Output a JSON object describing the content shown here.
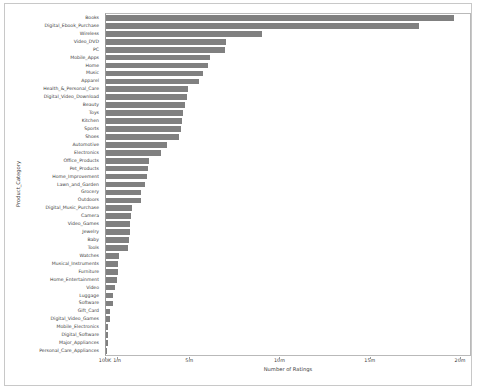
{
  "figure": {
    "background_color": "#ffffff",
    "border_color": "#c8c8c8",
    "bar_color": "#808080"
  },
  "chart_data": {
    "type": "bar",
    "orientation": "horizontal",
    "title": "",
    "xlabel": "Number of Ratings",
    "ylabel": "Product_Category",
    "xscale": "symlog",
    "xlim": [
      100000,
      20500000
    ],
    "xticks": [
      100000,
      1000000,
      5000000,
      10000000,
      15000000,
      20000000
    ],
    "xticklabels": [
      "100K",
      "1m",
      "5m",
      "10m",
      "15m",
      "20m"
    ],
    "grid": false,
    "legend": null,
    "categories": [
      "Books",
      "Digital_Ebook_Purchase",
      "Wireless",
      "Video_DVD",
      "PC",
      "Mobile_Apps",
      "Home",
      "Music",
      "Apparel",
      "Health_&_Personal_Care",
      "Digital_Video_Download",
      "Beauty",
      "Toys",
      "Kitchen",
      "Sports",
      "Shoes",
      "Automotive",
      "Electronics",
      "Office_Products",
      "Pet_Products",
      "Home_Improvement",
      "Lawn_and_Garden",
      "Grocery",
      "Outdoors",
      "Digital_Music_Purchase",
      "Camera",
      "Video_Games",
      "Jewelry",
      "Baby",
      "Tools",
      "Watches",
      "Musical_Instruments",
      "Furniture",
      "Home_Entertainment",
      "Video",
      "Luggage",
      "Software",
      "Gift_Card",
      "Digital_Video_Games",
      "Mobile_Electronics",
      "Digital_Software",
      "Major_Appliances",
      "Personal_Care_Appliances"
    ],
    "values": [
      19600000,
      17700000,
      9000000,
      7000000,
      6900000,
      6100000,
      6000000,
      5700000,
      5500000,
      4900000,
      4800000,
      4700000,
      4600000,
      4550000,
      4500000,
      4400000,
      3700000,
      3400000,
      2700000,
      2650000,
      2600000,
      2500000,
      2300000,
      2250000,
      1750000,
      1700000,
      1690000,
      1650000,
      1600000,
      1580000,
      1050000,
      1020000,
      950000,
      900000,
      520000,
      420000,
      400000,
      230000,
      210000,
      160000,
      150000,
      145000,
      130000
    ],
    "ylabel_order": "descending"
  }
}
